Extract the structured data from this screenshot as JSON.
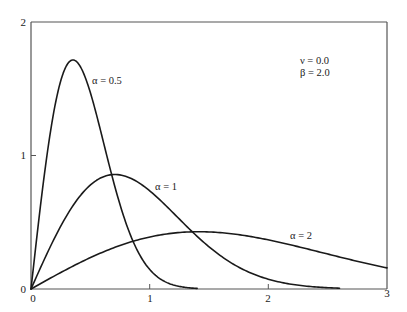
{
  "chart_data": {
    "type": "line",
    "title": "",
    "xlabel": "",
    "ylabel": "",
    "xlim": [
      0,
      3
    ],
    "ylim": [
      0,
      2
    ],
    "grid": false,
    "x_ticks": [
      "0",
      "1",
      "2",
      "3"
    ],
    "y_ticks": [
      "0",
      "1",
      "2"
    ],
    "annotations": {
      "nu": "ν = 0.0",
      "beta": "β = 2.0"
    },
    "series": [
      {
        "name": "α = 0.5",
        "alpha": 0.5,
        "x": [
          0,
          0.05,
          0.1,
          0.15,
          0.2,
          0.25,
          0.3,
          0.354,
          0.4,
          0.5,
          0.6,
          0.7,
          0.8,
          0.9,
          1.0,
          1.1,
          1.2,
          1.3,
          1.4
        ],
        "values": [
          0,
          0.396,
          0.769,
          1.097,
          1.363,
          1.558,
          1.674,
          1.716,
          1.704,
          1.472,
          1.137,
          0.787,
          0.494,
          0.283,
          0.147,
          0.069,
          0.03,
          0.012,
          0.004
        ]
      },
      {
        "name": "α = 1",
        "alpha": 1,
        "x": [
          0,
          0.1,
          0.2,
          0.3,
          0.4,
          0.5,
          0.6,
          0.707,
          0.8,
          0.9,
          1.0,
          1.2,
          1.4,
          1.6,
          1.8,
          2.0,
          2.2,
          2.4,
          2.6
        ],
        "values": [
          0,
          0.198,
          0.384,
          0.548,
          0.682,
          0.779,
          0.837,
          0.858,
          0.844,
          0.801,
          0.736,
          0.569,
          0.395,
          0.247,
          0.141,
          0.073,
          0.035,
          0.015,
          0.006
        ]
      },
      {
        "name": "α = 2",
        "alpha": 2,
        "x": [
          0,
          0.2,
          0.4,
          0.6,
          0.8,
          1.0,
          1.2,
          1.414,
          1.6,
          1.8,
          2.0,
          2.2,
          2.4,
          2.6,
          2.8,
          3.0
        ],
        "values": [
          0,
          0.099,
          0.192,
          0.274,
          0.341,
          0.389,
          0.419,
          0.429,
          0.422,
          0.401,
          0.368,
          0.328,
          0.284,
          0.24,
          0.197,
          0.158
        ]
      }
    ],
    "legend_position": "inline labels"
  },
  "labels": {
    "x0": "0",
    "x1": "1",
    "x2": "2",
    "x3": "3",
    "y0": "0",
    "y1": "1",
    "y2": "2",
    "curve_a05": "α = 0.5",
    "curve_a1": "α = 1",
    "curve_a2": "α = 2",
    "nu": "ν = 0.0",
    "beta": "β = 2.0"
  },
  "colors": {
    "axis": "#555555",
    "curve": "#1a1a1a",
    "background": "#ffffff"
  }
}
